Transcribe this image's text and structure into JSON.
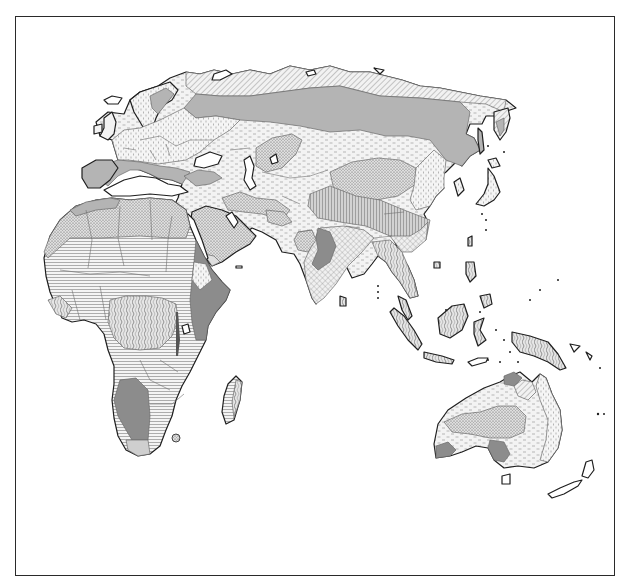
{
  "map": {
    "kind": "thematic biome / vegetation zone map",
    "extent": "Eastern Hemisphere: Europe, Africa, Asia, Australia, Oceania",
    "labels_visible": false,
    "legend_visible": false,
    "frame": {
      "x": 15,
      "y": 16,
      "width": 600,
      "height": 560,
      "stroke": "#2a2a2a"
    },
    "colors": {
      "background": "#ffffff",
      "coastline": "#1e1e1e",
      "borders": "#6e6e6e",
      "solid_gray": "#b4b4b4",
      "dark_gray": "#8c8c8c",
      "light_gray": "#cfcfcf",
      "pattern_ink": "#555555"
    },
    "zones": [
      {
        "id": "tundra",
        "pattern": "diagonal-hatch",
        "regions": [
          "northern Eurasia coast",
          "Scandinavia north",
          "Kamchatka tip"
        ]
      },
      {
        "id": "taiga",
        "pattern": "solid-gray",
        "regions": [
          "Siberia",
          "northern Russia",
          "Mediterranean coasts"
        ]
      },
      {
        "id": "temperate-forest",
        "pattern": "vertical-dash",
        "regions": [
          "Europe",
          "NE China",
          "eastern Australia"
        ]
      },
      {
        "id": "steppe",
        "pattern": "dashes",
        "regions": [
          "Central Asia",
          "Mongolia",
          "Australia interior ring"
        ]
      },
      {
        "id": "desert",
        "pattern": "stipple",
        "regions": [
          "Sahara",
          "Arabia",
          "Gobi",
          "Taklamakan",
          "Australian interior"
        ]
      },
      {
        "id": "savanna",
        "pattern": "horizontal-lines",
        "regions": [
          "Sahel",
          "southern Africa",
          "Madagascar"
        ]
      },
      {
        "id": "rainforest",
        "pattern": "wavy",
        "regions": [
          "Congo basin",
          "SE Asia",
          "Indonesia",
          "New Guinea"
        ]
      },
      {
        "id": "mountain-highland",
        "pattern": "vertical-lines",
        "regions": [
          "Tibetan Plateau"
        ]
      },
      {
        "id": "monsoon-forest",
        "pattern": "crosshatch",
        "regions": [
          "India",
          "South China",
          "Indochina"
        ]
      },
      {
        "id": "dry-shrub",
        "pattern": "dark-gray",
        "regions": [
          "East Africa",
          "Namibia/Kalahari",
          "Deccan west",
          "SW Australia"
        ]
      }
    ]
  }
}
